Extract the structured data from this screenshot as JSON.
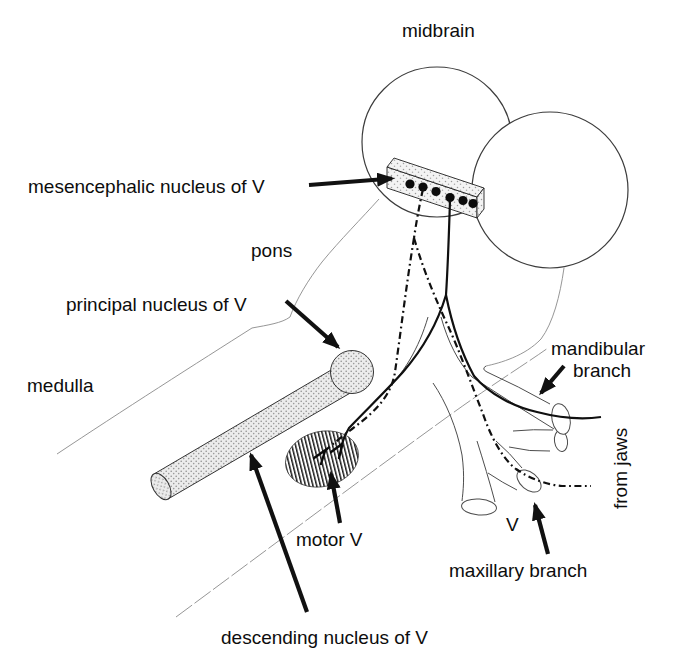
{
  "diagram": {
    "title_region": "midbrain",
    "background": "#ffffff",
    "ink_color": "#111111",
    "labels": {
      "midbrain": "midbrain",
      "mesencephalic_nucleus": "mesencephalic nucleus of V",
      "pons": "pons",
      "principal_nucleus": "principal nucleus of V",
      "medulla": "medulla",
      "motor_v": "motor V",
      "descending_nucleus": "descending nucleus of V",
      "mandibular_branch_line1": "mandibular",
      "mandibular_branch_line2": "branch",
      "from_jaws": "from jaws",
      "nerve_v": "V",
      "maxillary_branch": "maxillary branch"
    },
    "features": {
      "neuron_bead_count": 6,
      "hemisphere_circle_count": 2,
      "arrow_count": 6
    }
  }
}
